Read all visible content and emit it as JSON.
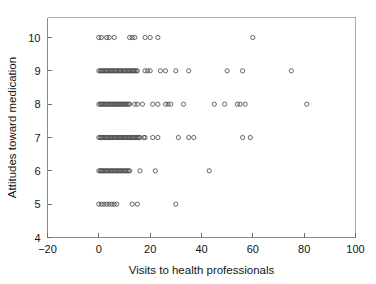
{
  "chart_data": {
    "type": "scatter",
    "title": "",
    "xlabel": "Visits to health professionals",
    "ylabel": "Attitudes toward medication",
    "xlim": [
      -20,
      100
    ],
    "ylim": [
      4,
      10.6
    ],
    "xticks": [
      -20,
      0,
      20,
      40,
      60,
      80,
      100
    ],
    "xtick_labels": [
      "−20",
      "0",
      "20",
      "40",
      "60",
      "80",
      "100"
    ],
    "yticks": [
      4,
      5,
      6,
      7,
      8,
      9,
      10
    ],
    "ytick_labels": [
      "4",
      "5",
      "6",
      "7",
      "8",
      "9",
      "10"
    ],
    "grid": false,
    "legend": false,
    "marker": "open-circle",
    "marker_color": "#4a4a4a",
    "marker_radius": 2.1,
    "series": [
      {
        "name": "respondents",
        "points": [
          [
            0,
            10
          ],
          [
            1,
            10
          ],
          [
            3,
            10
          ],
          [
            4,
            10
          ],
          [
            6,
            10
          ],
          [
            12,
            10
          ],
          [
            13,
            10
          ],
          [
            14,
            10
          ],
          [
            18,
            10
          ],
          [
            20,
            10
          ],
          [
            23,
            10
          ],
          [
            60,
            10
          ],
          [
            0,
            9
          ],
          [
            0.6,
            9
          ],
          [
            1,
            9
          ],
          [
            1.5,
            9
          ],
          [
            2,
            9
          ],
          [
            2.5,
            9
          ],
          [
            3,
            9
          ],
          [
            3.5,
            9
          ],
          [
            4,
            9
          ],
          [
            4.5,
            9
          ],
          [
            5,
            9
          ],
          [
            5.5,
            9
          ],
          [
            6,
            9
          ],
          [
            6.5,
            9
          ],
          [
            7,
            9
          ],
          [
            7.5,
            9
          ],
          [
            8,
            9
          ],
          [
            8.5,
            9
          ],
          [
            9,
            9
          ],
          [
            9.5,
            9
          ],
          [
            10,
            9
          ],
          [
            10.5,
            9
          ],
          [
            11,
            9
          ],
          [
            11.5,
            9
          ],
          [
            12,
            9
          ],
          [
            12.5,
            9
          ],
          [
            13,
            9
          ],
          [
            13.5,
            9
          ],
          [
            14,
            9
          ],
          [
            14.5,
            9
          ],
          [
            15,
            9
          ],
          [
            18,
            9
          ],
          [
            19,
            9
          ],
          [
            20,
            9
          ],
          [
            24,
            9
          ],
          [
            26,
            9
          ],
          [
            30,
            9
          ],
          [
            35,
            9
          ],
          [
            50,
            9
          ],
          [
            56,
            9
          ],
          [
            75,
            9
          ],
          [
            0,
            8
          ],
          [
            0.6,
            8
          ],
          [
            1,
            8
          ],
          [
            1.5,
            8
          ],
          [
            2,
            8
          ],
          [
            2.5,
            8
          ],
          [
            3,
            8
          ],
          [
            3.5,
            8
          ],
          [
            4,
            8
          ],
          [
            4.5,
            8
          ],
          [
            5,
            8
          ],
          [
            5.5,
            8
          ],
          [
            6,
            8
          ],
          [
            6.5,
            8
          ],
          [
            7,
            8
          ],
          [
            7.5,
            8
          ],
          [
            8,
            8
          ],
          [
            8.5,
            8
          ],
          [
            9,
            8
          ],
          [
            9.5,
            8
          ],
          [
            10,
            8
          ],
          [
            10.5,
            8
          ],
          [
            11,
            8
          ],
          [
            11.5,
            8
          ],
          [
            12,
            8
          ],
          [
            14,
            8
          ],
          [
            15,
            8
          ],
          [
            17,
            8
          ],
          [
            21,
            8
          ],
          [
            23,
            8
          ],
          [
            26,
            8
          ],
          [
            27,
            8
          ],
          [
            28,
            8
          ],
          [
            33,
            8
          ],
          [
            45,
            8
          ],
          [
            49,
            8
          ],
          [
            54,
            8
          ],
          [
            55,
            8
          ],
          [
            57,
            8
          ],
          [
            81,
            8
          ],
          [
            0,
            7
          ],
          [
            0.6,
            7
          ],
          [
            1,
            7
          ],
          [
            1.5,
            7
          ],
          [
            2,
            7
          ],
          [
            2.5,
            7
          ],
          [
            3,
            7
          ],
          [
            3.5,
            7
          ],
          [
            4,
            7
          ],
          [
            4.5,
            7
          ],
          [
            5,
            7
          ],
          [
            5.5,
            7
          ],
          [
            6,
            7
          ],
          [
            6.5,
            7
          ],
          [
            7,
            7
          ],
          [
            7.5,
            7
          ],
          [
            8,
            7
          ],
          [
            8.5,
            7
          ],
          [
            9,
            7
          ],
          [
            9.5,
            7
          ],
          [
            10,
            7
          ],
          [
            10.5,
            7
          ],
          [
            11,
            7
          ],
          [
            11.5,
            7
          ],
          [
            12,
            7
          ],
          [
            12.5,
            7
          ],
          [
            13,
            7
          ],
          [
            13.5,
            7
          ],
          [
            14,
            7
          ],
          [
            14.5,
            7
          ],
          [
            15,
            7
          ],
          [
            15.5,
            7
          ],
          [
            16,
            7
          ],
          [
            17.5,
            7
          ],
          [
            18,
            7
          ],
          [
            21,
            7
          ],
          [
            23,
            7
          ],
          [
            31,
            7
          ],
          [
            35,
            7
          ],
          [
            37,
            7
          ],
          [
            56,
            7
          ],
          [
            59,
            7
          ],
          [
            0,
            6
          ],
          [
            0.6,
            6
          ],
          [
            1,
            6
          ],
          [
            1.5,
            6
          ],
          [
            2,
            6
          ],
          [
            2.5,
            6
          ],
          [
            3,
            6
          ],
          [
            3.5,
            6
          ],
          [
            4,
            6
          ],
          [
            4.5,
            6
          ],
          [
            5,
            6
          ],
          [
            5.5,
            6
          ],
          [
            6,
            6
          ],
          [
            6.5,
            6
          ],
          [
            7,
            6
          ],
          [
            7.5,
            6
          ],
          [
            8,
            6
          ],
          [
            8.5,
            6
          ],
          [
            9,
            6
          ],
          [
            9.5,
            6
          ],
          [
            10,
            6
          ],
          [
            10.5,
            6
          ],
          [
            11,
            6
          ],
          [
            11.5,
            6
          ],
          [
            12,
            6
          ],
          [
            16,
            6
          ],
          [
            22,
            6
          ],
          [
            43,
            6
          ],
          [
            0,
            5
          ],
          [
            1,
            5
          ],
          [
            2,
            5
          ],
          [
            3,
            5
          ],
          [
            4,
            5
          ],
          [
            5,
            5
          ],
          [
            6,
            5
          ],
          [
            7,
            5
          ],
          [
            13,
            5
          ],
          [
            15,
            5
          ],
          [
            30,
            5
          ]
        ]
      }
    ]
  },
  "figure": {
    "background_color": "#ffffff",
    "frame_color": "#a8a8a8",
    "axis_color": "#8a8a8a",
    "text_color": "#141414"
  }
}
